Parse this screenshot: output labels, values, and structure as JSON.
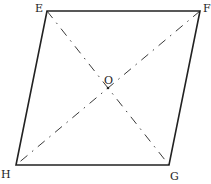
{
  "figure": {
    "type": "parallelogram",
    "vertices": [
      {
        "name": "E",
        "label": "E"
      },
      {
        "name": "F",
        "label": "F"
      },
      {
        "name": "G",
        "label": "G"
      },
      {
        "name": "H",
        "label": "H"
      }
    ],
    "center": {
      "name": "O",
      "label": "O"
    },
    "diagonals": [
      "EG",
      "FH"
    ],
    "diagonal_style": "dash-dot",
    "stroke_color": "#222222"
  }
}
